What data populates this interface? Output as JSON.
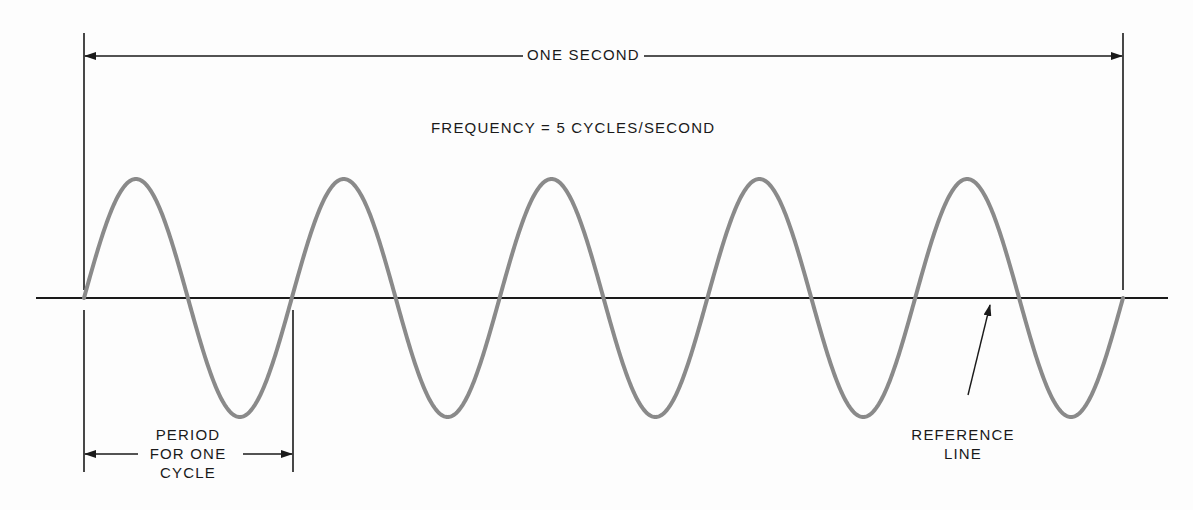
{
  "diagram": {
    "type": "sine-wave-frequency-illustration",
    "labels": {
      "duration": "ONE SECOND",
      "frequency": "FREQUENCY  =  5 CYCLES/SECOND",
      "period_line1": "PERIOD",
      "period_line2": "FOR ONE",
      "period_line3": "CYCLE",
      "reference_line1": "REFERENCE",
      "reference_line2": "LINE"
    },
    "wave": {
      "cycles": 5,
      "x_start": 84,
      "x_end": 1123,
      "baseline_y": 298,
      "amplitude": 119,
      "color": "#8a8a8a",
      "stroke_width": 4
    },
    "reference_line": {
      "x1": 36,
      "x2": 1168,
      "y": 298,
      "color": "#1a1a1a"
    },
    "one_second_bracket": {
      "x1": 84,
      "x2": 1123,
      "y": 56,
      "tick_top": 33,
      "tick_bottom": 290
    },
    "period_bracket": {
      "x1": 84,
      "x2": 293,
      "y": 454,
      "tick_top": 310,
      "tick_bottom": 472
    },
    "reference_pointer": {
      "from": [
        968,
        395
      ],
      "to": [
        990,
        305
      ]
    },
    "colors": {
      "ink": "#1a1a1a",
      "wave": "#8a8a8a",
      "background": "#fdfdfd"
    }
  }
}
